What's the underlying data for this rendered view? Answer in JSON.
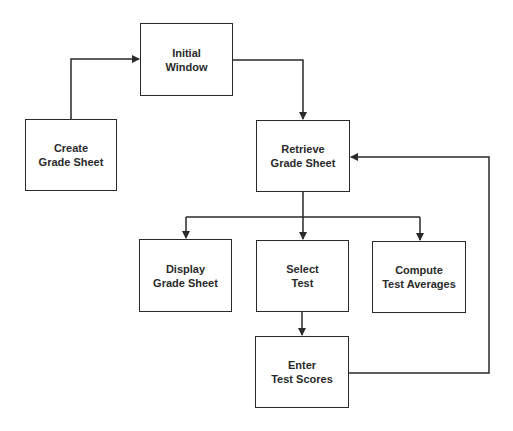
{
  "diagram": {
    "type": "flowchart",
    "nodes": [
      {
        "id": "initial",
        "line1": "Initial",
        "line2": "Window"
      },
      {
        "id": "create",
        "line1": "Create",
        "line2": "Grade Sheet"
      },
      {
        "id": "retrieve",
        "line1": "Retrieve",
        "line2": "Grade Sheet"
      },
      {
        "id": "display",
        "line1": "Display",
        "line2": "Grade Sheet"
      },
      {
        "id": "select",
        "line1": "Select",
        "line2": "Test"
      },
      {
        "id": "compute",
        "line1": "Compute",
        "line2": "Test Averages"
      },
      {
        "id": "enter",
        "line1": "Enter",
        "line2": "Test Scores"
      }
    ],
    "edges": [
      {
        "from": "initial",
        "to": "create",
        "bidirectional": true
      },
      {
        "from": "initial",
        "to": "retrieve",
        "bidirectional": false
      },
      {
        "from": "retrieve",
        "to": "display",
        "bidirectional": false
      },
      {
        "from": "retrieve",
        "to": "select",
        "bidirectional": true
      },
      {
        "from": "retrieve",
        "to": "compute",
        "bidirectional": false
      },
      {
        "from": "select",
        "to": "enter",
        "bidirectional": false
      },
      {
        "from": "enter",
        "to": "retrieve",
        "bidirectional": false
      }
    ],
    "colors": {
      "line": "#2a2a2a",
      "background": "#ffffff"
    }
  }
}
